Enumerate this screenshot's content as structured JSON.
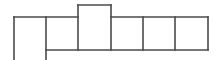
{
  "diagram": {
    "type": "grid-net",
    "stroke_color": "#4a4a4a",
    "stroke_width": 1.6,
    "vertical_lines": [
      {
        "x": 14,
        "y1": 17,
        "y2": 60
      },
      {
        "x": 46,
        "y1": 17,
        "y2": 60
      },
      {
        "x": 78,
        "y1": 5,
        "y2": 50
      },
      {
        "x": 111,
        "y1": 5,
        "y2": 50
      },
      {
        "x": 143,
        "y1": 17,
        "y2": 50
      },
      {
        "x": 175,
        "y1": 17,
        "y2": 50
      },
      {
        "x": 208,
        "y1": 17,
        "y2": 50
      }
    ],
    "horizontal_lines": [
      {
        "y": 17,
        "x1": 14,
        "x2": 78
      },
      {
        "y": 5,
        "x1": 78,
        "x2": 111
      },
      {
        "y": 17,
        "x1": 111,
        "x2": 208
      },
      {
        "y": 50,
        "x1": 46,
        "x2": 208
      }
    ],
    "cells": [
      {
        "id": "cell-1",
        "x": 14,
        "y": 17,
        "w": 32,
        "h": 43,
        "open_bottom": true
      },
      {
        "id": "cell-2",
        "x": 46,
        "y": 17,
        "w": 32,
        "h": 33
      },
      {
        "id": "cell-3-raised",
        "x": 78,
        "y": 5,
        "w": 33,
        "h": 45
      },
      {
        "id": "cell-4",
        "x": 111,
        "y": 17,
        "w": 32,
        "h": 33
      },
      {
        "id": "cell-5",
        "x": 143,
        "y": 17,
        "w": 32,
        "h": 33
      },
      {
        "id": "cell-6",
        "x": 175,
        "y": 17,
        "w": 33,
        "h": 33
      }
    ]
  }
}
